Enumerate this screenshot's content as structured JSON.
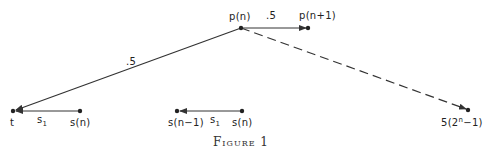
{
  "figure": {
    "caption": "Figure 1",
    "nodes": {
      "p_n": "p(n)",
      "p_n1": "p(n+1)",
      "t": "t",
      "s_n_left": "s(n)",
      "s_n_minus_1": "s(n−1)",
      "s_n_mid": "s(n)",
      "far_prefix": "5(2",
      "far_sup": "n",
      "far_suffix": "−1)"
    },
    "edge_labels": {
      "p_to_p1": ".5",
      "p_to_t": ".5",
      "s_to_t_s": "s",
      "s_to_t_sub": "1",
      "mid_s": "s",
      "mid_sub": "1"
    },
    "colors": {
      "line": "#333333",
      "background": "#ffffff"
    }
  }
}
